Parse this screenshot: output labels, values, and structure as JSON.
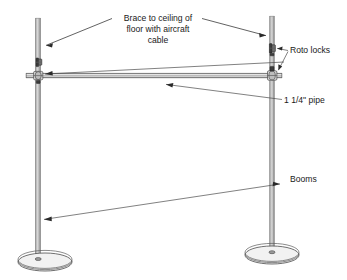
{
  "diagram": {
    "labels": {
      "brace_line1": "Brace to ceiling of",
      "brace_line2": "floor with aircraft",
      "brace_line3": "cable",
      "roto_locks": "Roto locks",
      "pipe_size": "1 1/4\" pipe",
      "booms": "Booms"
    },
    "colors": {
      "ink": "#1a1a1a",
      "leader": "#3a3a3a",
      "pipe_light": "#e8e8e8",
      "pipe_mid": "#b4b4b4",
      "pipe_edge": "#5e5e5e",
      "fitting": "#6e6e6e",
      "background": "#ffffff"
    },
    "geometry": {
      "left_post_x": 38,
      "right_post_x": 272,
      "left_post_top_y": 18,
      "right_post_top_y": 16,
      "crossbar_y": 75,
      "left_base_y": 262,
      "right_base_y": 255
    }
  }
}
